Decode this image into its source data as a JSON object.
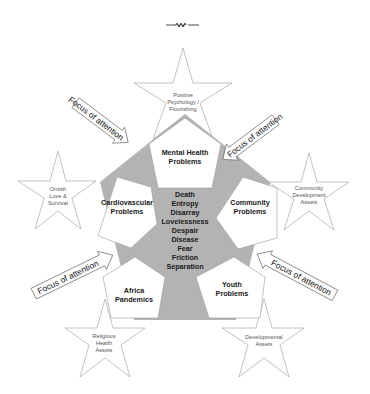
{
  "colors": {
    "background": "#ffffff",
    "core_fill": "#b3b3b3",
    "pentagon_fill": "#ffffff",
    "star_stroke": "#a8a8a8",
    "arrow_stroke": "#555555",
    "text": "#222222"
  },
  "ornament": {
    "icon": "wavy-divider-icon"
  },
  "core": {
    "lines": [
      "Death",
      "Entropy",
      "Disarray",
      "Lovelessness",
      "Despair",
      "Disease",
      "Fear",
      "Friction",
      "Separation"
    ]
  },
  "pentagons": [
    {
      "id": "mental-health",
      "line1": "Mental Health",
      "line2": "Problems"
    },
    {
      "id": "cardiovascular",
      "line1": "Cardiovascular",
      "line2": "Problems"
    },
    {
      "id": "community",
      "line1": "Community",
      "line2": "Problems"
    },
    {
      "id": "africa",
      "line1": "Africa",
      "line2": "Pandemics"
    },
    {
      "id": "youth",
      "line1": "Youth",
      "line2": "Problems"
    }
  ],
  "stars": [
    {
      "id": "positive-psychology",
      "line1": "Positive",
      "line2": "Psychology /",
      "line3": "Flourishing"
    },
    {
      "id": "ornish",
      "line1": "Ornish",
      "line2": "Love  &",
      "line3": "Survival"
    },
    {
      "id": "community-development",
      "line1": "Community",
      "line2": "Development",
      "line3": "Assets"
    },
    {
      "id": "religious-health",
      "line1": "Religious",
      "line2": "Health",
      "line3": "Assets"
    },
    {
      "id": "developmental",
      "line1": "Developmental",
      "line2": "Assets"
    }
  ],
  "arrows": [
    {
      "id": "top-left",
      "label": "Focus of attention"
    },
    {
      "id": "top-right",
      "label": "Focus of attention"
    },
    {
      "id": "bottom-left",
      "label": "Focus of attention"
    },
    {
      "id": "bottom-right",
      "label": "Focus of attention"
    }
  ]
}
